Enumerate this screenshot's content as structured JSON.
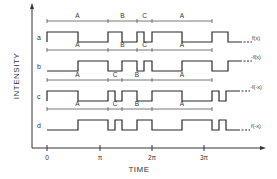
{
  "axes": {
    "x_label": "TIME",
    "y_label": "INTENSITY",
    "x_ticks": [
      {
        "label": "0",
        "x": 47
      },
      {
        "label": "π",
        "x": 100
      },
      {
        "label": "2π",
        "x": 152
      },
      {
        "label": "3π",
        "x": 204
      }
    ]
  },
  "traces": [
    {
      "label": "a",
      "function_label": "f(x)",
      "y_high": 32,
      "y_low": 42,
      "interval_y": 21,
      "intervals": [
        {
          "label": "A",
          "x0": 47,
          "x1": 108
        },
        {
          "label": "B",
          "x0": 108,
          "x1": 137
        },
        {
          "label": "C",
          "x0": 137,
          "x1": 152
        },
        {
          "label": "A",
          "x0": 152,
          "x1": 212
        }
      ],
      "start_level": "high",
      "transitions": [
        78,
        108,
        122,
        137,
        144,
        152,
        182,
        212,
        228
      ]
    },
    {
      "label": "b",
      "function_label": "-f(x)",
      "y_high": 61,
      "y_low": 71,
      "interval_y": 50,
      "intervals": [
        {
          "label": "A",
          "x0": 47,
          "x1": 108
        },
        {
          "label": "B",
          "x0": 108,
          "x1": 137
        },
        {
          "label": "C",
          "x0": 137,
          "x1": 152
        },
        {
          "label": "A",
          "x0": 152,
          "x1": 212
        }
      ],
      "start_level": "low",
      "transitions": [
        78,
        108,
        122,
        137,
        144,
        152,
        182,
        212,
        228
      ]
    },
    {
      "label": "c",
      "function_label": "-f(-x)",
      "y_high": 91,
      "y_low": 101,
      "interval_y": 80,
      "intervals": [
        {
          "label": "A",
          "x0": 47,
          "x1": 108
        },
        {
          "label": "C",
          "x0": 108,
          "x1": 122
        },
        {
          "label": "B",
          "x0": 122,
          "x1": 152
        },
        {
          "label": "A",
          "x0": 152,
          "x1": 212
        }
      ],
      "start_level": "high",
      "transitions": [
        78,
        108,
        115,
        122,
        137,
        152,
        182,
        212,
        219,
        226
      ]
    },
    {
      "label": "d",
      "function_label": "f(-x)",
      "y_high": 120,
      "y_low": 130,
      "interval_y": 109,
      "intervals": [
        {
          "label": "A",
          "x0": 47,
          "x1": 108
        },
        {
          "label": "C",
          "x0": 108,
          "x1": 122
        },
        {
          "label": "B",
          "x0": 122,
          "x1": 152
        },
        {
          "label": "A",
          "x0": 152,
          "x1": 212
        }
      ],
      "start_level": "low",
      "transitions": [
        78,
        108,
        115,
        122,
        137,
        152,
        182,
        212,
        219,
        226
      ]
    }
  ],
  "layout": {
    "origin_x": 32,
    "axis_y": 148,
    "wave_start": 47,
    "wave_end_solid_extra": 12,
    "dash_len": 12
  }
}
